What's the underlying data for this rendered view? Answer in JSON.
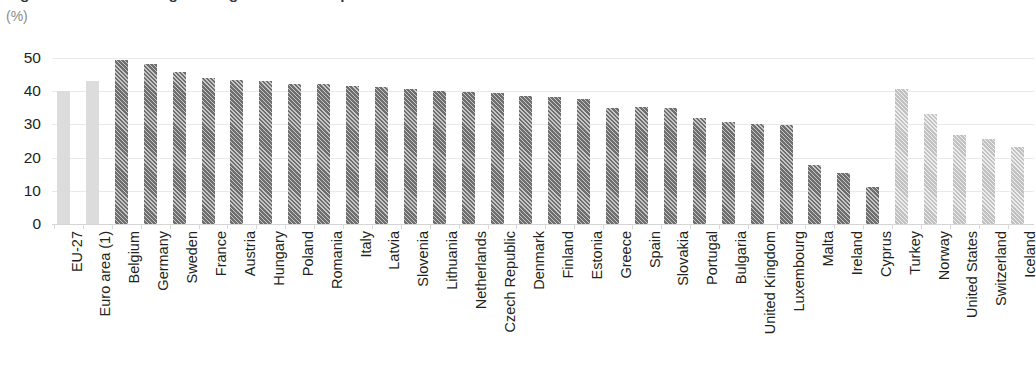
{
  "header": {
    "title_clipped": "Figure: Share of total general government expenditure in GDP",
    "unit_label": "(%)"
  },
  "chart_data": {
    "type": "bar",
    "title": "",
    "xlabel": "",
    "ylabel": "(%)",
    "ylim": [
      0,
      50
    ],
    "yticks": [
      0,
      10,
      20,
      30,
      40,
      50
    ],
    "grid": true,
    "legend": "none",
    "orientation": "vertical",
    "categories": [
      "EU-27",
      "Euro area (1)",
      "Belgium",
      "Germany",
      "Sweden",
      "France",
      "Austria",
      "Hungary",
      "Poland",
      "Romania",
      "Italy",
      "Latvia",
      "Slovenia",
      "Lithuania",
      "Netherlands",
      "Czech Republic",
      "Denmark",
      "Finland",
      "Estonia",
      "Greece",
      "Spain",
      "Slovakia",
      "Portugal",
      "Bulgaria",
      "United Kingdom",
      "Luxembourg",
      "Malta",
      "Ireland",
      "Cyprus",
      "Turkey",
      "Norway",
      "United States",
      "Switzerland",
      "Iceland"
    ],
    "values": [
      40.0,
      43.0,
      49.3,
      48.3,
      45.7,
      44.1,
      43.4,
      43.0,
      42.2,
      42.1,
      41.6,
      41.3,
      40.8,
      40.2,
      39.9,
      39.4,
      38.6,
      38.3,
      37.6,
      35.0,
      35.1,
      34.8,
      31.8,
      30.7,
      30.0,
      29.9,
      17.8,
      15.3,
      11.0,
      40.7,
      33.2,
      26.7,
      25.5,
      23.3
    ],
    "bar_styles": [
      "plain-light",
      "plain-light",
      "hatch-dark",
      "hatch-dark",
      "hatch-dark",
      "hatch-dark",
      "hatch-dark",
      "hatch-dark",
      "hatch-dark",
      "hatch-dark",
      "hatch-dark",
      "hatch-dark",
      "hatch-dark",
      "hatch-dark",
      "hatch-dark",
      "hatch-dark",
      "hatch-dark",
      "hatch-dark",
      "hatch-dark",
      "hatch-dark",
      "hatch-dark",
      "hatch-dark",
      "hatch-dark",
      "hatch-dark",
      "hatch-dark",
      "hatch-dark",
      "hatch-dark",
      "hatch-dark",
      "hatch-dark",
      "hatch-light",
      "hatch-light",
      "hatch-light",
      "hatch-light",
      "hatch-light"
    ],
    "colors": {
      "aggregate_bar": "#dcdcdc",
      "member_state_bar": "#6e6e6e",
      "non_member_bar": "#c2c2c2",
      "gridline": "#e9e9ea",
      "axis": "#d5d5d6",
      "text": "#231f20",
      "unit_text": "#8c8c8c"
    }
  }
}
